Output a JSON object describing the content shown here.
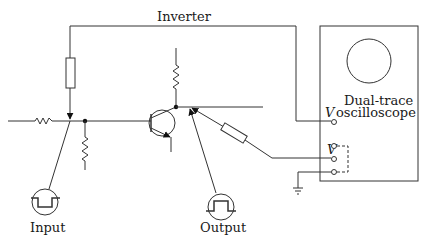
{
  "diagram": {
    "title_label": "Inverter",
    "input_label": "Input",
    "output_label": "Output",
    "scope": {
      "line1": "Dual-trace",
      "line2": "oscilloscope",
      "channel1_label": "V",
      "channel2_label": "V"
    },
    "components": [
      {
        "name": "input-series-resistor",
        "type": "resistor-zigzag"
      },
      {
        "name": "feedback-resistor",
        "type": "resistor-box"
      },
      {
        "name": "base-bias-resistor",
        "type": "resistor-zigzag"
      },
      {
        "name": "collector-load-resistor",
        "type": "resistor-zigzag"
      },
      {
        "name": "npn-transistor",
        "type": "transistor-npn"
      },
      {
        "name": "probe-resistor",
        "type": "resistor-box"
      },
      {
        "name": "input-square-wave-generator",
        "type": "pulse-source-negative"
      },
      {
        "name": "output-square-wave",
        "type": "pulse-source-positive"
      },
      {
        "name": "ground",
        "type": "ground"
      },
      {
        "name": "dual-trace-oscilloscope",
        "type": "instrument"
      }
    ]
  }
}
